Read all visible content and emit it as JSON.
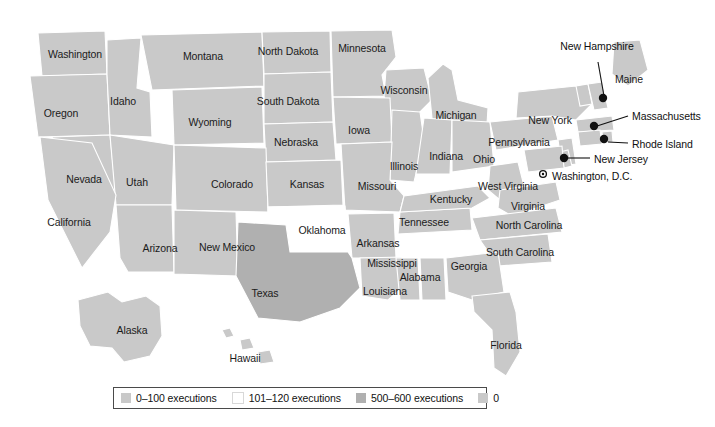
{
  "map": {
    "title": "",
    "colors": {
      "tier_low": "#c9c9c9",
      "tier_mid": "#ffffff",
      "tier_high": "#b0b0b0",
      "tier_zero": "#c9c9c9",
      "background": "#ffffff",
      "border": "#ffffff",
      "water": "#ffffff",
      "label_text": "#1b1b1b",
      "legend_border": "#4a4a4a"
    },
    "states": [
      {
        "name": "Washington",
        "x": 75,
        "y": 54,
        "tier": "tier_low"
      },
      {
        "name": "Oregon",
        "x": 61,
        "y": 113,
        "tier": "tier_low"
      },
      {
        "name": "Idaho",
        "x": 123,
        "y": 101,
        "tier": "tier_low"
      },
      {
        "name": "Montana",
        "x": 203,
        "y": 56,
        "tier": "tier_low"
      },
      {
        "name": "Wyoming",
        "x": 210,
        "y": 122,
        "tier": "tier_low"
      },
      {
        "name": "North Dakota",
        "x": 288,
        "y": 51,
        "tier": "tier_low"
      },
      {
        "name": "South Dakota",
        "x": 288,
        "y": 101,
        "tier": "tier_low"
      },
      {
        "name": "Nebraska",
        "x": 296,
        "y": 142,
        "tier": "tier_low"
      },
      {
        "name": "Minnesota",
        "x": 362,
        "y": 48,
        "tier": "tier_low"
      },
      {
        "name": "Wisconsin",
        "x": 404,
        "y": 90,
        "tier": "tier_low"
      },
      {
        "name": "Iowa",
        "x": 359,
        "y": 130,
        "tier": "tier_low"
      },
      {
        "name": "Michigan",
        "x": 456,
        "y": 115,
        "tier": "tier_low"
      },
      {
        "name": "Illinois",
        "x": 404,
        "y": 166,
        "tier": "tier_low"
      },
      {
        "name": "Indiana",
        "x": 446,
        "y": 156,
        "tier": "tier_low"
      },
      {
        "name": "Ohio",
        "x": 484,
        "y": 159,
        "tier": "tier_low"
      },
      {
        "name": "Nevada",
        "x": 84,
        "y": 179,
        "tier": "tier_low"
      },
      {
        "name": "Utah",
        "x": 137,
        "y": 182,
        "tier": "tier_low"
      },
      {
        "name": "Colorado",
        "x": 232,
        "y": 184,
        "tier": "tier_low"
      },
      {
        "name": "Kansas",
        "x": 307,
        "y": 184,
        "tier": "tier_low"
      },
      {
        "name": "Missouri",
        "x": 377,
        "y": 186,
        "tier": "tier_low"
      },
      {
        "name": "California",
        "x": 69,
        "y": 222,
        "tier": "tier_low"
      },
      {
        "name": "Arizona",
        "x": 160,
        "y": 248,
        "tier": "tier_low"
      },
      {
        "name": "New Mexico",
        "x": 227,
        "y": 247,
        "tier": "tier_low"
      },
      {
        "name": "Oklahoma",
        "x": 322,
        "y": 230,
        "tier": "tier_mid"
      },
      {
        "name": "Arkansas",
        "x": 378,
        "y": 243,
        "tier": "tier_low"
      },
      {
        "name": "Texas",
        "x": 265,
        "y": 293,
        "tier": "tier_high"
      },
      {
        "name": "Louisiana",
        "x": 385,
        "y": 291,
        "tier": "tier_low"
      },
      {
        "name": "Mississippi",
        "x": 392,
        "y": 263,
        "tier": "tier_low"
      },
      {
        "name": "Alabama",
        "x": 420,
        "y": 277,
        "tier": "tier_low"
      },
      {
        "name": "Tennessee",
        "x": 424,
        "y": 222,
        "tier": "tier_low"
      },
      {
        "name": "Kentucky",
        "x": 451,
        "y": 199,
        "tier": "tier_low"
      },
      {
        "name": "West Virginia",
        "x": 508,
        "y": 186,
        "tier": "tier_low"
      },
      {
        "name": "Virginia",
        "x": 528,
        "y": 206,
        "tier": "tier_low"
      },
      {
        "name": "North Carolina",
        "x": 529,
        "y": 225,
        "tier": "tier_low"
      },
      {
        "name": "South Carolina",
        "x": 520,
        "y": 252,
        "tier": "tier_low"
      },
      {
        "name": "Georgia",
        "x": 469,
        "y": 266,
        "tier": "tier_low"
      },
      {
        "name": "Florida",
        "x": 506,
        "y": 345,
        "tier": "tier_low"
      },
      {
        "name": "Pennsylvania",
        "x": 519,
        "y": 142,
        "tier": "tier_low"
      },
      {
        "name": "New York",
        "x": 550,
        "y": 120,
        "tier": "tier_low"
      },
      {
        "name": "Maine",
        "x": 629,
        "y": 79,
        "tier": "tier_low"
      },
      {
        "name": "Alaska",
        "x": 132,
        "y": 330,
        "tier": "tier_low"
      },
      {
        "name": "Hawaii",
        "x": 245,
        "y": 358,
        "tier": "tier_low"
      }
    ],
    "callouts": [
      {
        "name": "New Hampshire",
        "label_x": 597,
        "label_y": 40,
        "dot_x": 603,
        "dot_y": 98,
        "line": "M 598 62 L 604 96"
      },
      {
        "name": "Massachusetts",
        "label_x": 632,
        "label_y": 110,
        "dot_x": 594,
        "dot_y": 126,
        "line": "M 628 116 L 597 126"
      },
      {
        "name": "Rhode Island",
        "label_x": 632,
        "label_y": 138,
        "dot_x": 604,
        "dot_y": 139,
        "line": "M 628 143 L 608 142"
      },
      {
        "name": "New Jersey",
        "label_x": 594,
        "label_y": 153,
        "dot_x": 564,
        "dot_y": 158,
        "line": "M 590 158 L 568 158"
      }
    ],
    "city": {
      "name": "Washington, D.C.",
      "label_x": 552,
      "label_y": 170,
      "marker_x": 543,
      "marker_y": 174
    }
  },
  "legend": {
    "items": [
      {
        "label": "0–100 executions",
        "swatch": "#c9c9c9",
        "border": "none"
      },
      {
        "label": "101–120 executions",
        "swatch": "#ffffff",
        "border": "none"
      },
      {
        "label": "500–600 executions",
        "swatch": "#b0b0b0",
        "border": "none"
      },
      {
        "label": "0",
        "swatch": "#c9c9c9",
        "border": "none"
      }
    ]
  }
}
